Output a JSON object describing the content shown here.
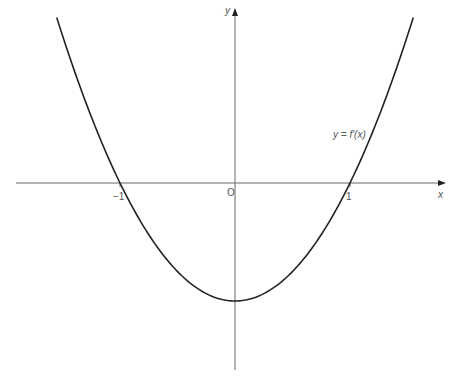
{
  "figure": {
    "curve_label": "y = f'(x)",
    "axis_x_label": "x",
    "axis_y_label": "y",
    "origin_label": "O",
    "tick_neg1": "−1",
    "tick_pos1": "1",
    "colors": {
      "curve": "#222222",
      "axis": "#666666",
      "text": "#555555"
    }
  },
  "chart_data": {
    "type": "line",
    "title": "",
    "xlabel": "x",
    "ylabel": "y",
    "series": [
      {
        "name": "y = f'(x)",
        "function": "x^2 - 1",
        "x": [
          -1.55,
          -1.5,
          -1.25,
          -1,
          -0.75,
          -0.5,
          -0.25,
          0,
          0.25,
          0.5,
          0.75,
          1,
          1.25,
          1.5,
          1.55
        ],
        "y": [
          1.4,
          1.25,
          0.5625,
          0,
          -0.4375,
          -0.75,
          -0.9375,
          -1,
          -0.9375,
          -0.75,
          -0.4375,
          0,
          0.5625,
          1.25,
          1.4
        ]
      }
    ],
    "x_ticks": [
      -1,
      1
    ],
    "x_tick_labels": [
      "−1",
      "1"
    ],
    "origin_label": "O",
    "grid": false,
    "annotations": [
      "y = f'(x)"
    ],
    "xlim": [
      -1.9,
      1.8
    ],
    "ylim": [
      -1.6,
      1.5
    ]
  }
}
